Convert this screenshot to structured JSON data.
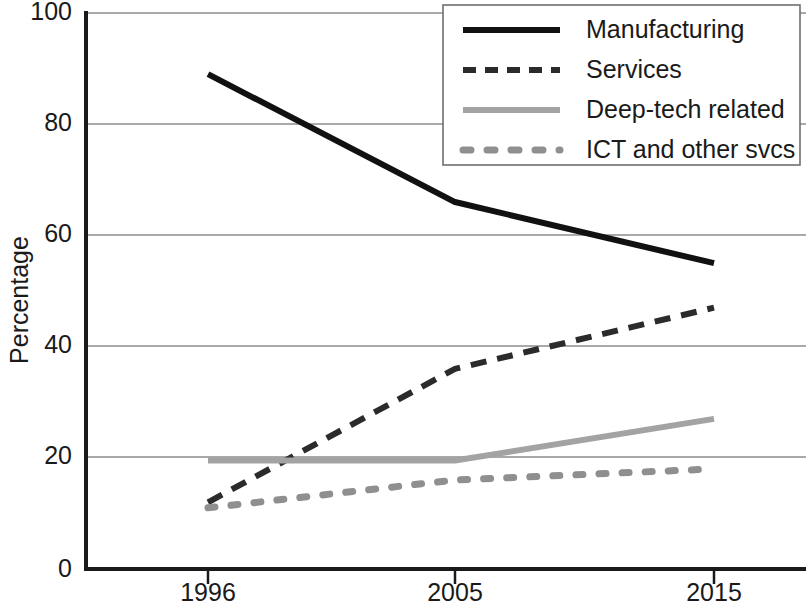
{
  "chart_data": {
    "type": "line",
    "title": "",
    "xlabel": "",
    "ylabel": "Percentage",
    "x": [
      1996,
      2005,
      2015
    ],
    "categories": [
      "1996",
      "2005",
      "2015"
    ],
    "xtick_labels": [
      "1996",
      "2005",
      "2015"
    ],
    "ytick_labels": [
      "0",
      "20",
      "40",
      "60",
      "80",
      "100"
    ],
    "yticks": [
      0,
      20,
      40,
      60,
      80,
      100
    ],
    "ylim": [
      0,
      100
    ],
    "grid": "horizontal",
    "legend_position": "top-right",
    "series": [
      {
        "name": "Manufacturing",
        "values": [
          89,
          66,
          55
        ],
        "style": "solid",
        "color": "#111111",
        "width": 6
      },
      {
        "name": "Services",
        "values": [
          12,
          36,
          47
        ],
        "style": "dashed",
        "color": "#2b2b2b",
        "width": 6
      },
      {
        "name": "Deep-tech related",
        "values": [
          19.5,
          19.5,
          27
        ],
        "style": "solid",
        "color": "#a3a3a3",
        "width": 6
      },
      {
        "name": "ICT and other svcs",
        "values": [
          11,
          16,
          18
        ],
        "style": "dotted",
        "color": "#8f8f8f",
        "width": 7
      }
    ]
  },
  "legend": {
    "entries": [
      {
        "label": "Manufacturing"
      },
      {
        "label": "Services"
      },
      {
        "label": "Deep-tech related"
      },
      {
        "label": "ICT and other svcs"
      }
    ]
  },
  "axes": {
    "y_title": "Percentage",
    "y_ticks": [
      "100",
      "80",
      "60",
      "40",
      "20",
      "0"
    ],
    "x_ticks": [
      "1996",
      "2005",
      "2015"
    ]
  },
  "colors": {
    "manufacturing": "#111111",
    "services": "#2b2b2b",
    "deep_tech": "#a3a3a3",
    "ict": "#8f8f8f",
    "grid": "#8d8d8d",
    "axis": "#1a1a1a",
    "background": "#ffffff"
  }
}
